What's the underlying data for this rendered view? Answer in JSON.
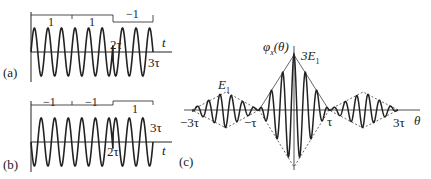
{
  "panels": {
    "a": {
      "tag": "(a)",
      "code": [
        "1",
        "1",
        "−1"
      ],
      "axis_label": "t",
      "marks": [
        "2τ",
        "3τ"
      ]
    },
    "b": {
      "tag": "(b)",
      "code": [
        "−1",
        "−1",
        "1"
      ],
      "axis_label": "t",
      "marks": [
        "2τ",
        "3τ"
      ]
    },
    "c": {
      "tag": "(c)",
      "y_label": "φx(θ)",
      "x_label": "θ",
      "peak_label": "3E1",
      "side_label": "E1",
      "ticks": [
        "−3τ",
        "−τ",
        "τ",
        "3τ"
      ]
    }
  },
  "colors": {
    "stroke": "#222222",
    "background": "#ffffff"
  }
}
